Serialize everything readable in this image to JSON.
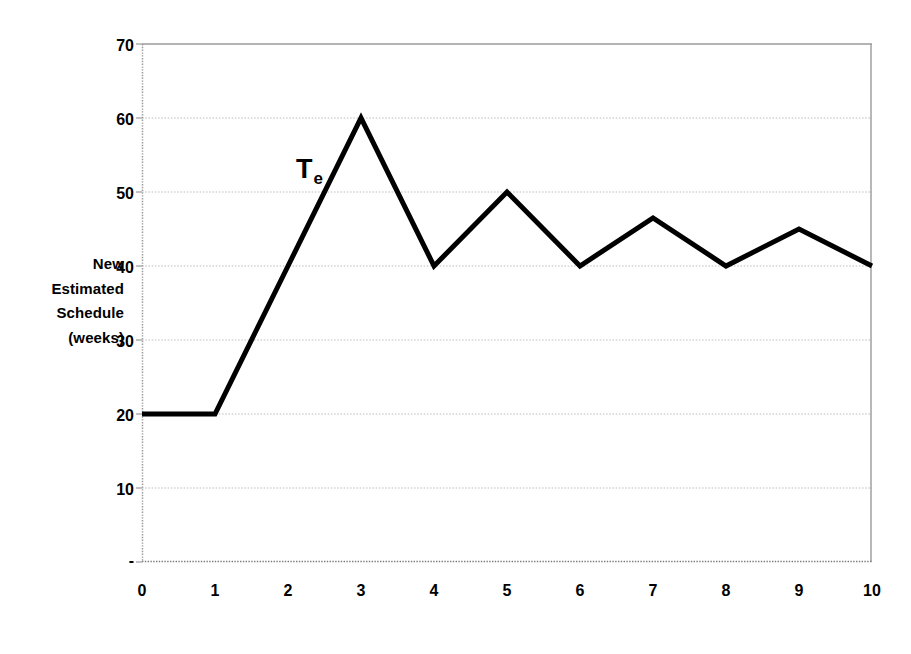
{
  "chart_data": {
    "type": "line",
    "title": "",
    "xlabel": "Weeks on Project",
    "ylabel": "New Estimated Schedule (weeks)",
    "ylabel_lines": [
      "New",
      "Estimated",
      "Schedule",
      "(weeks)"
    ],
    "x": [
      0,
      1,
      2,
      3,
      4,
      5,
      6,
      7,
      8,
      9,
      10
    ],
    "series": [
      {
        "name": "Te",
        "values": [
          20,
          20,
          40,
          60,
          40,
          50,
          40,
          46.5,
          40,
          45,
          40
        ],
        "color": "#000000",
        "line_width": 5
      }
    ],
    "xlim": [
      0,
      10
    ],
    "ylim": [
      0,
      70
    ],
    "xticks": [
      "0",
      "1",
      "2",
      "3",
      "4",
      "5",
      "6",
      "7",
      "8",
      "9",
      "10"
    ],
    "yticks": [
      "-",
      "10",
      "20",
      "30",
      "40",
      "50",
      "60",
      "70"
    ],
    "ytick_values": [
      0,
      10,
      20,
      30,
      40,
      50,
      60,
      70
    ],
    "grid": true,
    "grid_axis": "y",
    "grid_style": "dotted",
    "grid_color": "#bfbfbf",
    "axis_color": "#808080",
    "legend": false,
    "annotations": [
      {
        "text": "T",
        "subscript": "e",
        "x": 2.3,
        "y": 53
      }
    ],
    "plot_background": "#ffffff"
  },
  "colors": {
    "line": "#000000",
    "grid": "#bfbfbf",
    "axis": "#808080",
    "text": "#000000",
    "background": "#ffffff"
  }
}
